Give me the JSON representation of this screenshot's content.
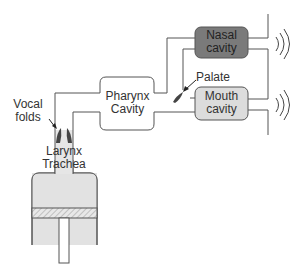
{
  "diagram": {
    "type": "vocal-tract-source-filter-model",
    "labels": {
      "vocal_folds_line1": "Vocal",
      "vocal_folds_line2": "folds",
      "pharynx_line1": "Pharynx",
      "pharynx_line2": "Cavity",
      "nasal_line1": "Nasal",
      "nasal_line2": "cavity",
      "mouth_line1": "Mouth",
      "mouth_line2": "cavity",
      "palate": "Palate",
      "larynx": "Larynx",
      "trachea": "Trachea"
    },
    "colors": {
      "line": "#555555",
      "nasal_fill": "#7a7a7a",
      "mouth_fill": "#dcdcdc",
      "lung_fill": "#e2e2e2",
      "larynx_fill": "#e6e6e6",
      "folds_fill": "#444444",
      "palate_fill": "#444444"
    },
    "icons": [
      "sound-wave-icon",
      "sound-wave-icon"
    ]
  }
}
